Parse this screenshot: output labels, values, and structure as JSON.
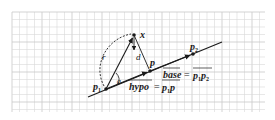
{
  "figure": {
    "type": "geometry-diagram",
    "background": "#ffffff",
    "grid_color": "#d9d9d9",
    "ink_color": "#1a1a1a",
    "grid": {
      "x0": 12,
      "y0": 12,
      "x1": 265,
      "y1": 112,
      "spacing": 7.5
    },
    "points": {
      "p1": {
        "x": 106,
        "y": 89,
        "label": "p",
        "sub": "1"
      },
      "p2": {
        "x": 193,
        "y": 54,
        "label": "p",
        "sub": "2"
      },
      "p": {
        "x": 150,
        "y": 71,
        "label": "p"
      },
      "x": {
        "x": 134,
        "y": 35,
        "label": "x"
      }
    },
    "line": {
      "x1": 88,
      "y1": 97,
      "x2": 222,
      "y2": 42
    },
    "labels": {
      "r": "r",
      "d": "d",
      "a": "a",
      "x": "x",
      "p": "p",
      "p1": "p",
      "p1_sub": "1",
      "p2": "p",
      "p2_sub": "2",
      "base_lhs": "base",
      "base_eq": "=",
      "base_rhs_p": "p",
      "base_rhs_sub1": "1",
      "base_rhs_p2": "p",
      "base_rhs_sub2": "2",
      "hypo_lhs": "hypo",
      "hypo_eq": "=",
      "hypo_rhs_p": "p",
      "hypo_rhs_sub1": "1",
      "hypo_rhs_p2": "p"
    }
  }
}
